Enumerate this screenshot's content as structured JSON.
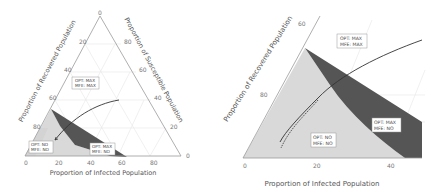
{
  "figure": {
    "left_panel": {
      "type": "ternary",
      "axis_labels": {
        "bottom": "Proportion of Infected Population",
        "left": "Proportion of Recovered Population",
        "right": "Proportion of Susceptible Population"
      },
      "bottom_ticks": [
        "0",
        "20",
        "40",
        "60",
        "80"
      ],
      "left_ticks": [
        "20",
        "40",
        "60",
        "80"
      ],
      "right_ticks": [
        "80",
        "60",
        "40",
        "20"
      ],
      "apex_tick": "0",
      "right_corner_tick": "0",
      "regions": [
        {
          "label_line1": "OPT: MAX",
          "label_line2": "MFE: MAX"
        },
        {
          "label_line1": "OPT: NO",
          "label_line2": "MFE: NO"
        },
        {
          "label_line1": "OPT: MAX",
          "label_line2": "MFE: NO"
        }
      ]
    },
    "right_panel": {
      "type": "ternary-zoom",
      "axis_labels": {
        "bottom": "Proportion of Infected Population",
        "left": "Proportion of Recovered Population"
      },
      "bottom_ticks": [
        "0",
        "20",
        "40"
      ],
      "left_ticks": [
        "60",
        "80"
      ],
      "regions": [
        {
          "label_line1": "OPT: MAX",
          "label_line2": "MFE: MAX"
        },
        {
          "label_line1": "OPT: NO",
          "label_line2": "MFE: NO"
        },
        {
          "label_line1": "OPT: MAX",
          "label_line2": "MFE: NO"
        }
      ]
    },
    "colors": {
      "light_region": "#d9d9d9",
      "dark_region": "#555555",
      "axis": "#9a9a9a",
      "grid": "#e4e4e4",
      "curve": "#333333"
    }
  }
}
